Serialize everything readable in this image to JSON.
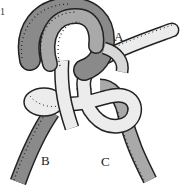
{
  "figure": {
    "corner_mark": "1",
    "labels": {
      "a": "A",
      "b": "B",
      "c": "C"
    },
    "colors": {
      "dark_rope": "#8a8a8a",
      "mid_rope": "#a9a9a9",
      "light_rope": "#ececec",
      "outline": "#222222",
      "background": "#ffffff"
    }
  }
}
